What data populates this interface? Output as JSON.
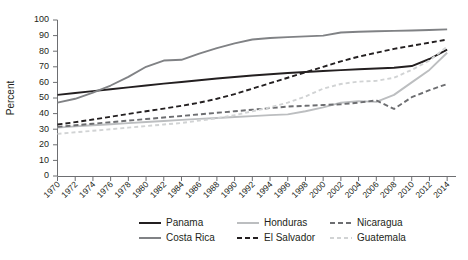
{
  "chart_data": {
    "type": "line",
    "title": "",
    "xlabel": "",
    "ylabel": "Percent",
    "ylim": [
      0,
      100
    ],
    "ytick_values": [
      0,
      10,
      20,
      30,
      40,
      50,
      60,
      70,
      80,
      90,
      100
    ],
    "xlim": [
      1970,
      2015
    ],
    "grid": false,
    "legend_position": "bottom",
    "x": [
      1970,
      1972,
      1974,
      1976,
      1978,
      1980,
      1982,
      1984,
      1986,
      1988,
      1990,
      1992,
      1994,
      1996,
      1998,
      2000,
      2002,
      2004,
      2006,
      2008,
      2010,
      2012,
      2014
    ],
    "xtick_labels": [
      "1970",
      "1972",
      "1974",
      "1976",
      "1978",
      "1980",
      "1982",
      "1984",
      "1986",
      "1988",
      "1990",
      "1992",
      "1994",
      "1996",
      "1998",
      "2000",
      "2002",
      "2004",
      "2006",
      "2008",
      "2010",
      "2012",
      "2014"
    ],
    "series": [
      {
        "name": "Panama",
        "color": "#231f20",
        "dash": "none",
        "width": 1.9,
        "values": [
          52.0,
          53.2,
          54.4,
          55.6,
          56.8,
          58.0,
          59.2,
          60.3,
          61.4,
          62.5,
          63.5,
          64.4,
          65.2,
          66.0,
          66.7,
          67.3,
          67.9,
          68.4,
          68.9,
          69.4,
          70.5,
          75.0,
          81.0
        ]
      },
      {
        "name": "Costa Rica",
        "color": "#808285",
        "dash": "none",
        "width": 1.9,
        "values": [
          47.0,
          49.5,
          53.5,
          58.0,
          63.5,
          70.0,
          74.0,
          74.5,
          78.5,
          82.0,
          85.0,
          87.5,
          88.5,
          89.0,
          89.5,
          90.0,
          92.0,
          92.5,
          92.8,
          93.0,
          93.3,
          93.6,
          94.0
        ]
      },
      {
        "name": "Honduras",
        "color": "#bcbec0",
        "dash": "none",
        "width": 1.9,
        "values": [
          31.0,
          31.8,
          32.5,
          33.2,
          33.9,
          34.6,
          35.3,
          36.0,
          36.6,
          37.2,
          37.8,
          38.4,
          39.0,
          39.5,
          41.5,
          44.0,
          47.0,
          48.0,
          47.5,
          52.0,
          60.0,
          68.0,
          79.0
        ]
      },
      {
        "name": "El Salvador",
        "color": "#231f20",
        "dash": "5,3",
        "width": 1.9,
        "values": [
          33.0,
          34.5,
          36.2,
          38.0,
          39.8,
          41.5,
          43.2,
          45.0,
          47.0,
          49.5,
          52.5,
          56.0,
          59.5,
          63.0,
          66.5,
          70.0,
          73.5,
          76.5,
          79.0,
          81.5,
          83.5,
          85.5,
          87.5
        ]
      },
      {
        "name": "Nicaragua",
        "color": "#6d6e71",
        "dash": "5,3",
        "width": 1.9,
        "values": [
          31.5,
          32.5,
          33.5,
          34.5,
          35.5,
          36.5,
          37.5,
          38.5,
          39.5,
          40.5,
          41.5,
          42.5,
          43.5,
          44.5,
          45.0,
          45.5,
          46.0,
          47.0,
          48.5,
          43.0,
          50.5,
          55.0,
          59.0
        ]
      },
      {
        "name": "Guatemala",
        "color": "#d1d3d4",
        "dash": "4,3",
        "width": 1.9,
        "values": [
          27.0,
          28.0,
          29.0,
          30.0,
          31.0,
          32.0,
          33.0,
          34.0,
          35.5,
          37.0,
          39.0,
          41.5,
          44.0,
          47.0,
          51.0,
          56.0,
          59.0,
          60.5,
          61.0,
          63.0,
          68.0,
          74.0,
          83.0
        ]
      }
    ],
    "legend": [
      {
        "label": "Panama",
        "color": "#231f20",
        "dash": "none"
      },
      {
        "label": "Honduras",
        "color": "#bcbec0",
        "dash": "none"
      },
      {
        "label": "Nicaragua",
        "color": "#6d6e71",
        "dash": "5,3"
      },
      {
        "label": "Costa Rica",
        "color": "#808285",
        "dash": "none"
      },
      {
        "label": "El Salvador",
        "color": "#231f20",
        "dash": "5,3"
      },
      {
        "label": "Guatemala",
        "color": "#d1d3d4",
        "dash": "4,3"
      }
    ]
  }
}
